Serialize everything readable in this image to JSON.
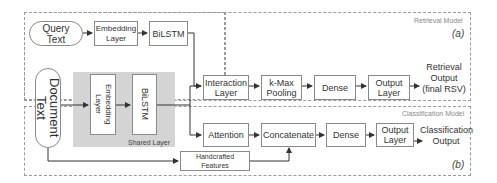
{
  "retrieval_model": {
    "title": "Retrieval Model",
    "tag": "(a)",
    "output": "Retrieval Output (final RSV)",
    "nodes": {
      "query": "Query Text",
      "embedding": "Embedding Layer",
      "bilstm": "BiLSTM",
      "interaction": "Interaction Layer",
      "kmax": "k-Max Pooling",
      "dense": "Dense",
      "output_layer": "Output Layer"
    }
  },
  "shared": {
    "document": "Document Text",
    "embedding": "Embedding Layer",
    "bilstm": "BiLSTM",
    "label": "Shared Layer"
  },
  "classification_model": {
    "title": "Classification Model",
    "tag": "(b)",
    "output": "Classification Output",
    "nodes": {
      "attention": "Attention",
      "concatenate": "Concatenate",
      "dense": "Dense",
      "output_layer": "Output Layer",
      "handcrafted": "Handcrafted Features"
    }
  },
  "colors": {
    "border": "#8a8a8a",
    "shared_bg": "#d4d4d4",
    "arrow": "#333333"
  }
}
